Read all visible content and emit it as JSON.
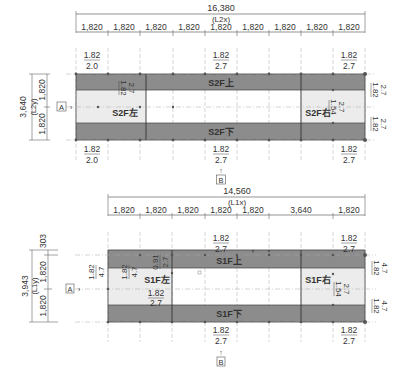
{
  "plan_2f": {
    "overall_x": "16,380",
    "overall_x_label": "(L2x)",
    "spans_x": [
      "1,820",
      "1,820",
      "1,820",
      "1,820",
      "1,820",
      "1,820",
      "1,820",
      "1,820",
      "1,820"
    ],
    "overall_y": "3,640",
    "overall_y_label": "(L2y)",
    "spans_y": [
      "1,820",
      "1,820"
    ],
    "grid_a": "A",
    "grid_b": "B",
    "zones": {
      "top": "S2F上",
      "bottom": "S2F下",
      "left": "S2F左",
      "right": "S2F右"
    },
    "ratios": {
      "top_left": {
        "num": "1.82",
        "den": "2.0"
      },
      "top_mid": {
        "num": "1.82",
        "den": "2.7"
      },
      "top_right": {
        "num": "1.82",
        "den": "2.7"
      },
      "bottom_left": {
        "num": "1.82",
        "den": "2.0"
      },
      "bottom_mid": {
        "num": "1.82",
        "den": "2.7"
      },
      "bottom_right": {
        "num": "1.82",
        "den": "2.7"
      },
      "left_inner": {
        "num": "1.82",
        "den": "2.7"
      },
      "right_inner": {
        "num": "1.54",
        "den": "2.7"
      },
      "right_upper": {
        "num": "1.82",
        "den": "2.7"
      },
      "right_lower": {
        "num": "1.82",
        "den": "2.7"
      }
    }
  },
  "plan_1f": {
    "overall_x": "14,560",
    "overall_x_label": "(L1x)",
    "spans_x": [
      "1,820",
      "1,820",
      "1,820",
      "1,820",
      "1,820",
      "3,640",
      "1,820"
    ],
    "overall_y": "3,943",
    "overall_y_label": "(L1y)",
    "spans_y": [
      "303",
      "1,820",
      "1,820"
    ],
    "grid_a": "A",
    "grid_b": "B",
    "zones": {
      "top": "S1F上",
      "bottom": "S1F下",
      "left": "S1F左",
      "right": "S1F右"
    },
    "ratios": {
      "top_mid": {
        "num": "1.82",
        "den": "2.7"
      },
      "top_right": {
        "num": "1.82",
        "den": "2.7"
      },
      "bottom_mid": {
        "num": "1.82",
        "den": "2.7"
      },
      "bottom_right": {
        "num": "1.82",
        "den": "2.7"
      },
      "left_outer": {
        "num": "1.82",
        "den": "4.7"
      },
      "left_inner": {
        "num": "1.82",
        "den": "4.7"
      },
      "left_step": {
        "num": "0.91",
        "den": "2.7"
      },
      "left_lower": {
        "num": "1.82",
        "den": "2.7"
      },
      "right_inner": {
        "num": "1.54",
        "den": "2.7"
      },
      "right_upper": {
        "num": "1.82",
        "den": "4.7"
      },
      "right_lower": {
        "num": "1.82",
        "den": "4.7"
      }
    }
  },
  "colors": {
    "dark_band": "#8c8c8c",
    "light_zone": "#ececec",
    "line": "#444444",
    "grid_line": "#999999"
  }
}
